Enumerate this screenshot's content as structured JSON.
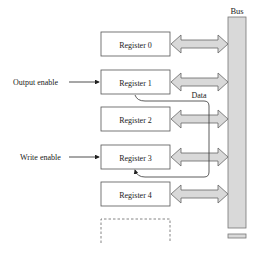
{
  "diagram": {
    "bus": {
      "label": "Bus",
      "fill": "#d9d9d9",
      "stroke": "#777777"
    },
    "arrow_fill": "#d9d9d9",
    "registers": [
      {
        "label": "Register 0",
        "y": 32
      },
      {
        "label": "Register 1",
        "y": 70
      },
      {
        "label": "Register 2",
        "y": 107
      },
      {
        "label": "Register 3",
        "y": 145
      },
      {
        "label": "Register 4",
        "y": 182
      }
    ],
    "output_enable": {
      "label": "Output enable",
      "target": "Register 1"
    },
    "write_enable": {
      "label": "Write enable",
      "target": "Register 3"
    },
    "data_label": "Data"
  }
}
